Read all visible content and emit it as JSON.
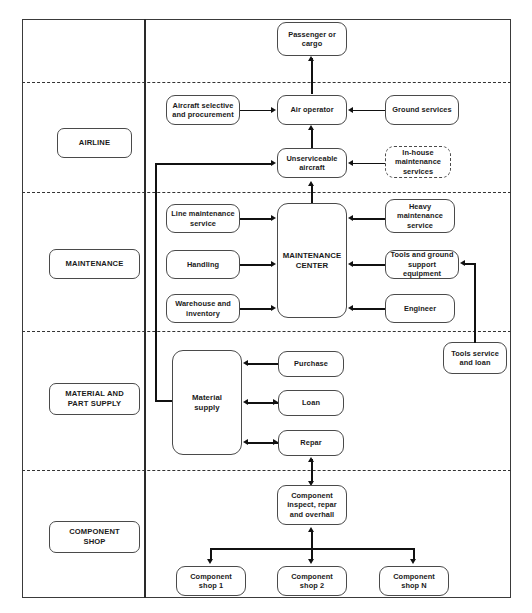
{
  "diagram": {
    "frame": {
      "border_color": "#3a3a3a",
      "background": "#ffffff"
    },
    "lanes": [
      {
        "id": "airline",
        "label": "AIRLINE"
      },
      {
        "id": "maintenance",
        "label": "MAINTENANCE"
      },
      {
        "id": "material",
        "label": "MATERIAL AND\nPART SUPPLY",
        "line1": "MATERIAL AND",
        "line2": "PART SUPPLY"
      },
      {
        "id": "component",
        "label": "COMPONENT\nSHOP",
        "line1": "COMPONENT",
        "line2": "SHOP"
      }
    ],
    "nodes": [
      {
        "id": "passenger-or-cargo",
        "line1": "Passenger or",
        "line2": "cargo",
        "line3": "",
        "style": "solid"
      },
      {
        "id": "air-operator",
        "line1": "Air operator",
        "line2": "",
        "line3": "",
        "style": "solid"
      },
      {
        "id": "aircraft-selective",
        "line1": "Aircraft selective",
        "line2": "and procurement",
        "line3": "",
        "style": "solid"
      },
      {
        "id": "ground-services",
        "line1": "Ground services",
        "line2": "",
        "line3": "",
        "style": "solid"
      },
      {
        "id": "unserviceable-aircraft",
        "line1": "Unserviceable",
        "line2": "aircraft",
        "line3": "",
        "style": "solid"
      },
      {
        "id": "in-house-maintenance",
        "line1": "In-house",
        "line2": "maintenance",
        "line3": "services",
        "style": "dashed"
      },
      {
        "id": "maintenance-center",
        "line1": "MAINTENANCE",
        "line2": "CENTER",
        "line3": "",
        "style": "solid"
      },
      {
        "id": "line-maintenance-service",
        "line1": "Line maintenance",
        "line2": "service",
        "line3": "",
        "style": "solid"
      },
      {
        "id": "handling",
        "line1": "Handling",
        "line2": "",
        "line3": "",
        "style": "solid"
      },
      {
        "id": "warehouse-and-inventory",
        "line1": "Warehouse and",
        "line2": "inventory",
        "line3": "",
        "style": "solid"
      },
      {
        "id": "heavy-maintenance-service",
        "line1": "Heavy",
        "line2": "maintenance",
        "line3": "service",
        "style": "solid"
      },
      {
        "id": "tools-and-ground-support",
        "line1": "Tools and ground",
        "line2": "support equipment",
        "line3": "",
        "style": "solid"
      },
      {
        "id": "engineer",
        "line1": "Engineer",
        "line2": "",
        "line3": "",
        "style": "solid"
      },
      {
        "id": "tools-service-and-loan",
        "line1": "Tools service",
        "line2": "and loan",
        "line3": "",
        "style": "solid"
      },
      {
        "id": "material-supply",
        "line1": "Material",
        "line2": "supply",
        "line3": "",
        "style": "solid"
      },
      {
        "id": "purchase",
        "line1": "Purchase",
        "line2": "",
        "line3": "",
        "style": "solid"
      },
      {
        "id": "loan",
        "line1": "Loan",
        "line2": "",
        "line3": "",
        "style": "solid"
      },
      {
        "id": "repar",
        "line1": "Repar",
        "line2": "",
        "line3": "",
        "style": "solid"
      },
      {
        "id": "component-inspect",
        "line1": "Component",
        "line2": "inspect, repar",
        "line3": "and overhall",
        "style": "solid"
      },
      {
        "id": "component-shop-1",
        "line1": "Component",
        "line2": "shop 1",
        "line3": "",
        "style": "solid"
      },
      {
        "id": "component-shop-2",
        "line1": "Component",
        "line2": "shop 2",
        "line3": "",
        "style": "solid"
      },
      {
        "id": "component-shop-n",
        "line1": "Component",
        "line2": "shop N",
        "line3": "",
        "style": "solid"
      }
    ],
    "edges": [
      {
        "from": "air-operator",
        "to": "passenger-or-cargo",
        "direction": "up"
      },
      {
        "from": "aircraft-selective",
        "to": "air-operator",
        "direction": "right"
      },
      {
        "from": "ground-services",
        "to": "air-operator",
        "direction": "left"
      },
      {
        "from": "unserviceable-aircraft",
        "to": "air-operator",
        "direction": "both-vertical"
      },
      {
        "from": "in-house-maintenance",
        "to": "unserviceable-aircraft",
        "direction": "left"
      },
      {
        "from": "maintenance-center",
        "to": "unserviceable-aircraft",
        "direction": "up"
      },
      {
        "from": "line-maintenance-service",
        "to": "maintenance-center",
        "direction": "right"
      },
      {
        "from": "handling",
        "to": "maintenance-center",
        "direction": "right"
      },
      {
        "from": "warehouse-and-inventory",
        "to": "maintenance-center",
        "direction": "right"
      },
      {
        "from": "heavy-maintenance-service",
        "to": "maintenance-center",
        "direction": "left"
      },
      {
        "from": "tools-and-ground-support",
        "to": "maintenance-center",
        "direction": "left"
      },
      {
        "from": "engineer",
        "to": "maintenance-center",
        "direction": "left"
      },
      {
        "from": "tools-service-and-loan",
        "to": "tools-and-ground-support",
        "direction": "left"
      },
      {
        "from": "material-supply",
        "to": "unserviceable-aircraft",
        "direction": "right"
      },
      {
        "from": "purchase",
        "to": "material-supply",
        "direction": "left"
      },
      {
        "from": "loan",
        "to": "material-supply",
        "direction": "both-horizontal"
      },
      {
        "from": "repar",
        "to": "material-supply",
        "direction": "both-horizontal"
      },
      {
        "from": "component-inspect",
        "to": "repar",
        "direction": "both-vertical"
      },
      {
        "from": "component-inspect",
        "to": "component-shop-1",
        "direction": "down"
      },
      {
        "from": "component-inspect",
        "to": "component-shop-2",
        "direction": "down"
      },
      {
        "from": "component-inspect",
        "to": "component-shop-n",
        "direction": "down"
      }
    ]
  }
}
